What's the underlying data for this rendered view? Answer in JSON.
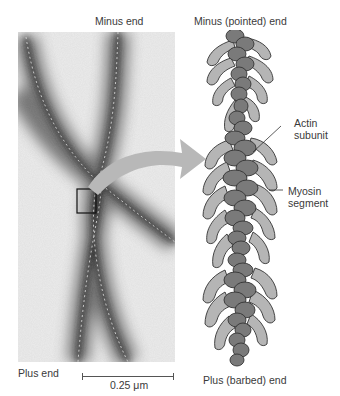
{
  "micrograph": {
    "top_label": "Minus end",
    "bottom_label": "Plus end",
    "scale_bar_label": "0.25 μm"
  },
  "model": {
    "top_label": "Minus (pointed) end",
    "bottom_label": "Plus (barbed) end",
    "annotations": [
      {
        "line1": "Actin",
        "line2": "subunit"
      },
      {
        "line1": "Myosin",
        "line2": "segment"
      }
    ]
  },
  "colors": {
    "actin_fill": "#7a7a7a",
    "myosin_fill": "#b5b5b5",
    "outline": "#333333",
    "arrow": "#b8b8b8",
    "background": "#ffffff"
  }
}
